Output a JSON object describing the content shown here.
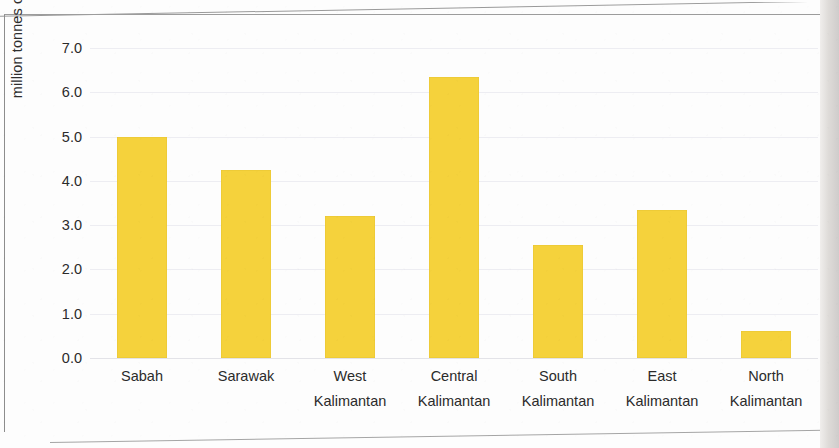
{
  "chart_data": {
    "type": "bar",
    "title": "",
    "subtitle": "",
    "xlabel": "",
    "ylabel": "million tonnes of CPO",
    "ylim": [
      0.0,
      7.0
    ],
    "ytick_labels": [
      "7.0",
      "6.0",
      "5.0",
      "4.0",
      "3.0",
      "2.0",
      "1.0",
      "0.0"
    ],
    "ytick_values": [
      7.0,
      6.0,
      5.0,
      4.0,
      3.0,
      2.0,
      1.0,
      0.0
    ],
    "grid": "horizontal",
    "legend": "none",
    "bar_color": "#f5d23c",
    "categories": [
      "Sabah",
      "West Kalimantan",
      "Sarawak",
      "Central Kalimantan",
      "South Kalimantan",
      "East Kalimantan",
      "North Kalimantan"
    ],
    "category_lines": [
      {
        "line1": "Sabah",
        "line2": ""
      },
      {
        "line1": "Sarawak",
        "line2": ""
      },
      {
        "line1": "West",
        "line2": "Kalimantan"
      },
      {
        "line1": "Central",
        "line2": "Kalimantan"
      },
      {
        "line1": "South",
        "line2": "Kalimantan"
      },
      {
        "line1": "East",
        "line2": "Kalimantan"
      },
      {
        "line1": "North",
        "line2": "Kalimantan"
      }
    ],
    "values": [
      5.0,
      4.25,
      3.2,
      6.35,
      2.55,
      3.35,
      0.6
    ],
    "series": [
      {
        "name": "CPO production",
        "values": [
          5.0,
          4.25,
          3.2,
          6.35,
          2.55,
          3.35,
          0.6
        ]
      }
    ]
  },
  "figure": {
    "frame_color": "#8d8d8d",
    "background": "#fdfdfd",
    "axis_text_color": "#2b2b2b"
  }
}
